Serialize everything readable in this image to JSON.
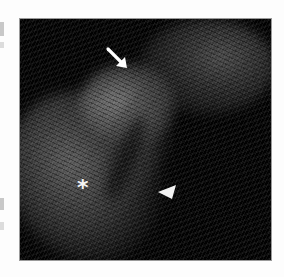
{
  "image": {
    "kind": "ultrasound-scan",
    "background_color": "#fdfdfd",
    "panel_color": "#020202",
    "annotations": [
      {
        "type": "arrow",
        "symbol": "arrow-down-right-icon",
        "color": "#ffffff"
      },
      {
        "type": "asterisk",
        "symbol": "*",
        "color": "#f4f4f4"
      },
      {
        "type": "arrowhead",
        "symbol": "arrowhead-left-icon",
        "color": "#ffffff"
      }
    ]
  }
}
